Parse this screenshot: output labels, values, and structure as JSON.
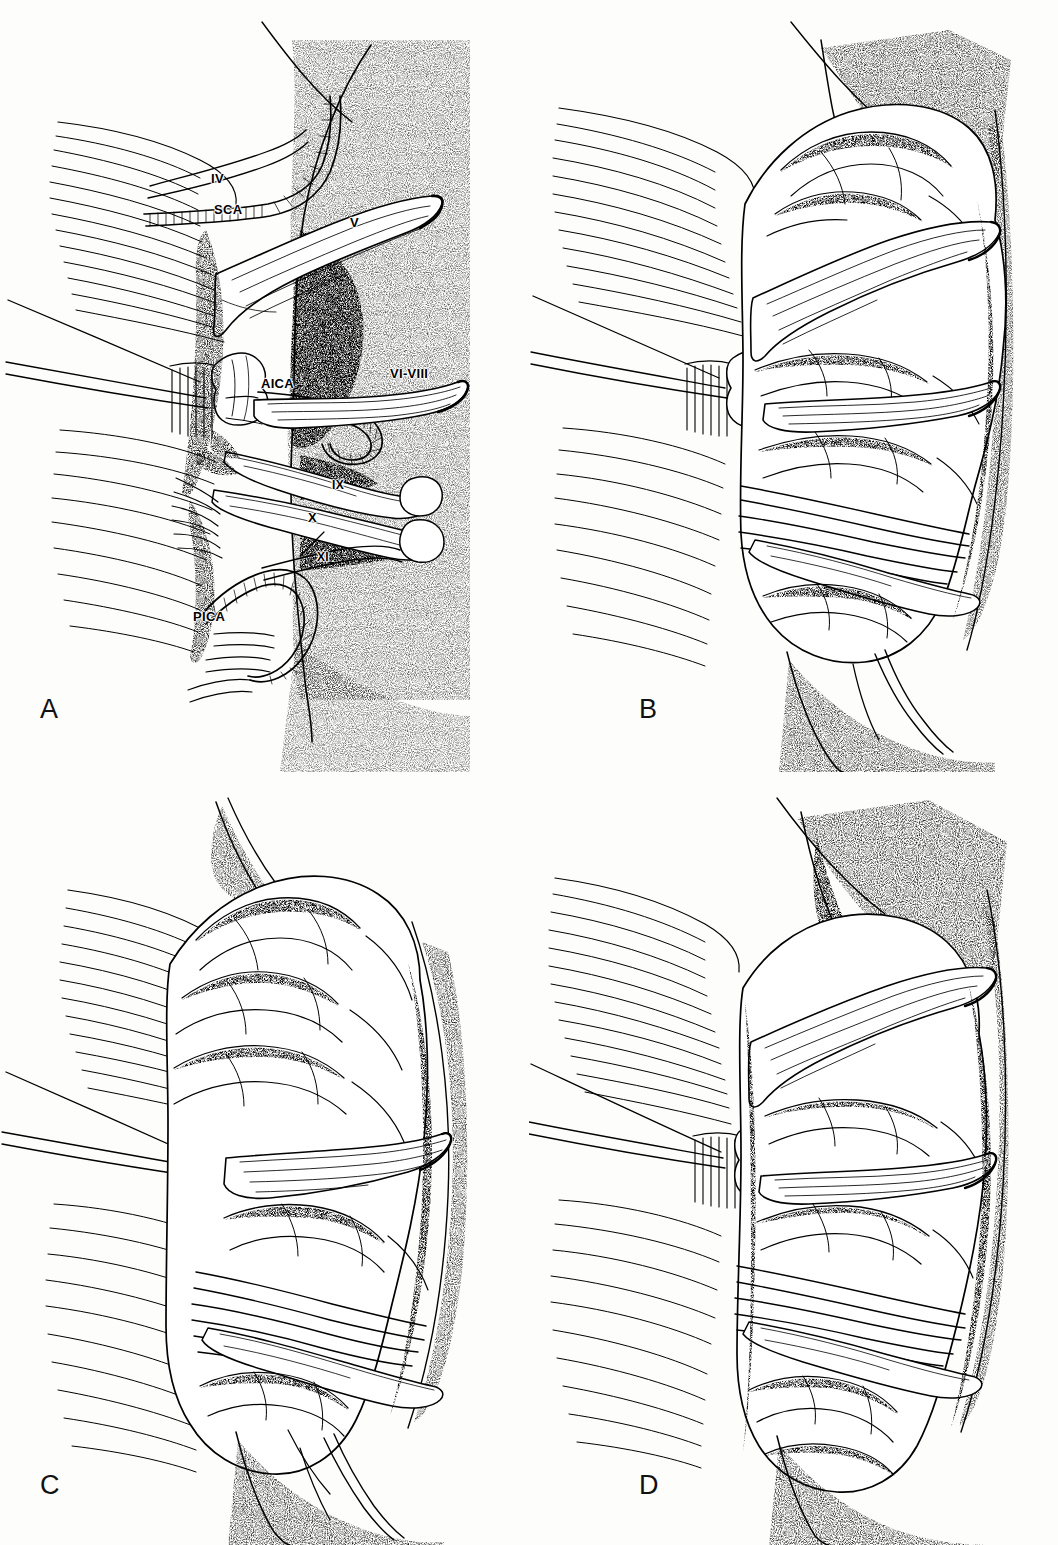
{
  "figure": {
    "style": "pen-and-ink stipple line drawing",
    "background_color": "#fdfdfc",
    "ink_color": "#000000",
    "panel_count": 4
  },
  "panels": [
    {
      "id": "A",
      "letter": "A",
      "description": "Cranial nerves and arteries of the cerebellopontine angle exposed, cerebellum retracted; all neurovascular structures labelled.",
      "has_labels": true,
      "labels": [
        {
          "text": "IV",
          "name": "trochlear-nerve",
          "x": 211,
          "y": 172,
          "kind": "roman-numeral"
        },
        {
          "text": "SCA",
          "name": "superior-cerebellar-artery",
          "x": 214,
          "y": 203,
          "kind": "artery-abbreviation"
        },
        {
          "text": "V",
          "name": "trigeminal-nerve",
          "x": 350,
          "y": 216,
          "kind": "roman-numeral"
        },
        {
          "text": "AICA",
          "name": "anterior-inferior-cerebellar-artery",
          "x": 261,
          "y": 377,
          "kind": "artery-abbreviation"
        },
        {
          "text": "VI-VIII",
          "name": "abducens-to-vestibulocochlear-nerves",
          "x": 390,
          "y": 367,
          "kind": "roman-numeral"
        },
        {
          "text": "IX",
          "name": "glossopharyngeal-nerve",
          "x": 332,
          "y": 479,
          "kind": "roman-numeral"
        },
        {
          "text": "X",
          "name": "vagus-nerve",
          "x": 308,
          "y": 511,
          "kind": "roman-numeral"
        },
        {
          "text": "XI",
          "name": "accessory-nerve",
          "x": 317,
          "y": 551,
          "kind": "roman-numeral"
        },
        {
          "text": "PICA",
          "name": "posterior-inferior-cerebellar-artery",
          "x": 193,
          "y": 610,
          "kind": "artery-abbreviation"
        }
      ]
    },
    {
      "id": "B",
      "letter": "B",
      "description": "Cerebellum in place covering the nerves; folia visible, nerve bundles crossing the cerebellar surface. No labels.",
      "has_labels": true,
      "labels": []
    },
    {
      "id": "C",
      "letter": "C",
      "description": "Cerebellum rotated with upper folia prominent and nerve bundles stretched across the lower surface. No labels.",
      "has_labels": true,
      "labels": []
    },
    {
      "id": "D",
      "letter": "D",
      "description": "Deeper retraction showing horizontal nerve bundles crossing a heavily foliated cerebellar hemisphere. No labels.",
      "has_labels": true,
      "labels": []
    }
  ]
}
